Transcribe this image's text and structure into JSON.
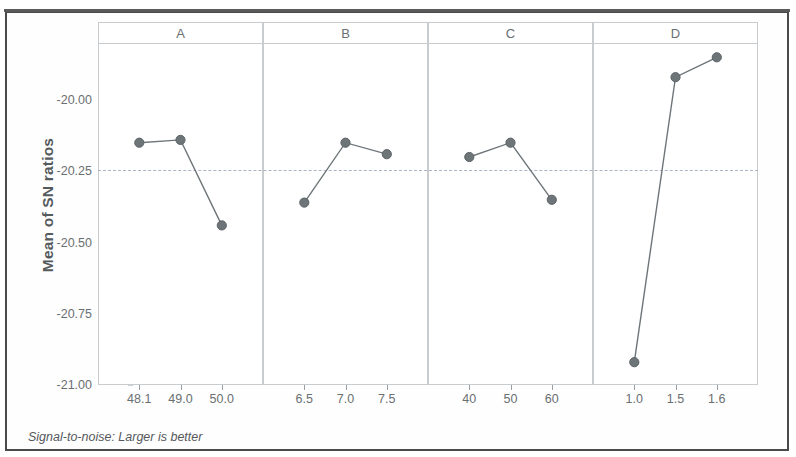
{
  "chart_data": {
    "type": "line",
    "title": "",
    "subtitle": "",
    "xlabel": "",
    "ylabel": "Mean of SN ratios",
    "ylim": [
      -21.05,
      -19.78
    ],
    "yticks": [
      "-20.00",
      "-20.25",
      "-20.50",
      "-20.75",
      "-21.00"
    ],
    "ytick_values": [
      -20.0,
      -20.25,
      -20.5,
      -20.75,
      -21.0
    ],
    "grid": false,
    "legend": "none",
    "reference_line": -20.246,
    "marker": "filled-circle",
    "marker_color": "#6e7579",
    "line_color": "#6e7579",
    "annotation": "Signal-to-noise: Larger is better",
    "panels": [
      {
        "name": "A",
        "categories": [
          "48.1",
          "49.0",
          "50.0"
        ],
        "values": [
          -20.15,
          -20.14,
          -20.44
        ]
      },
      {
        "name": "B",
        "categories": [
          "6.5",
          "7.0",
          "7.5"
        ],
        "values": [
          -20.36,
          -20.15,
          -20.19
        ]
      },
      {
        "name": "C",
        "categories": [
          "40",
          "50",
          "60"
        ],
        "values": [
          -20.2,
          -20.15,
          -20.35
        ]
      },
      {
        "name": "D",
        "categories": [
          "1.0",
          "1.5",
          "1.6"
        ],
        "values": [
          -20.92,
          -19.92,
          -19.85
        ]
      }
    ]
  },
  "footnote": {
    "text": "Signal-to-noise: Larger is better"
  },
  "axis": {
    "y_title": "Mean of SN ratios"
  }
}
